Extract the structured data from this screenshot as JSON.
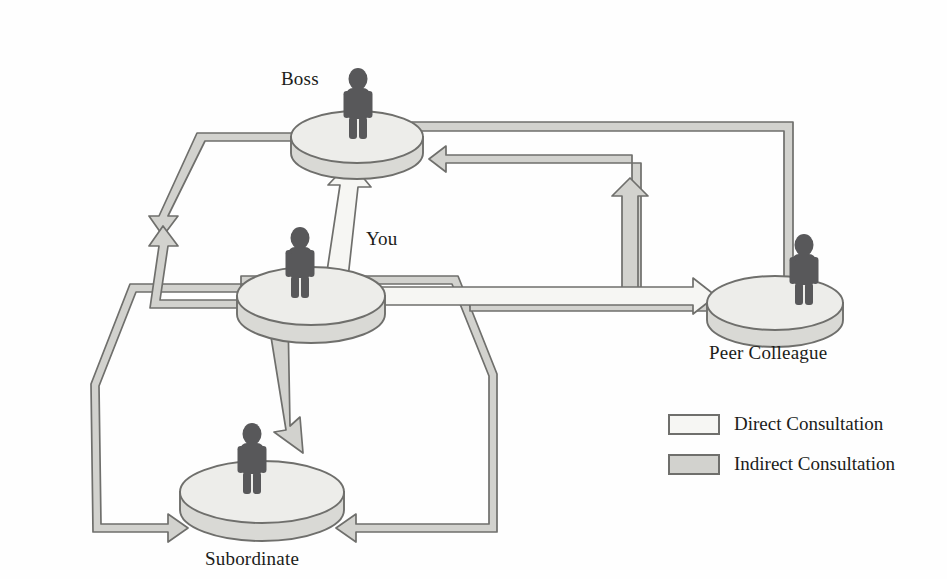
{
  "diagram": {
    "nodes": [
      {
        "id": "boss",
        "label": "Boss",
        "label_x": 281,
        "label_y": 68,
        "cx": 357,
        "cy": 137,
        "rx": 66,
        "ry": 26,
        "figure": "person-silhouette"
      },
      {
        "id": "you",
        "label": "You",
        "label_x": 366,
        "label_y": 228,
        "cx": 311,
        "cy": 296,
        "rx": 74,
        "ry": 29,
        "figure": "person-silhouette"
      },
      {
        "id": "peer",
        "label": "Peer Colleague",
        "label_x": 709,
        "label_y": 342,
        "cx": 775,
        "cy": 303,
        "rx": 68,
        "ry": 27,
        "figure": "person-silhouette"
      },
      {
        "id": "subordinate",
        "label": "Subordinate",
        "label_x": 205,
        "label_y": 548,
        "cx": 262,
        "cy": 492,
        "rx": 82,
        "ry": 31,
        "figure": "person-silhouette"
      }
    ],
    "edges": [
      {
        "from": "you",
        "to": "boss",
        "kind": "direct",
        "shape": "vertical-arrow-up"
      },
      {
        "from": "you",
        "to": "peer",
        "kind": "direct",
        "shape": "horizontal-arrow-right"
      },
      {
        "from": "you",
        "to": "subordinate",
        "kind": "direct",
        "shape": "diagonal-arrow-down"
      },
      {
        "from": "boss",
        "to": "you",
        "kind": "indirect",
        "shape": "left-loop-bidirectional"
      },
      {
        "from": "boss",
        "to": "peer",
        "kind": "indirect",
        "shape": "right-outer-loop"
      },
      {
        "from": "peer",
        "to": "boss",
        "kind": "indirect",
        "shape": "right-inner-loop"
      },
      {
        "from": "you",
        "to": "subordinate",
        "kind": "indirect",
        "shape": "lower-left-loop"
      },
      {
        "from": "you",
        "to": "subordinate",
        "kind": "indirect",
        "shape": "lower-right-loop"
      }
    ]
  },
  "legend": {
    "items": [
      {
        "swatch": "direct",
        "label": "Direct Consultation"
      },
      {
        "swatch": "indirect",
        "label": "Indirect Consultation"
      }
    ]
  },
  "colors": {
    "direct_fill": "#f6f6f3",
    "indirect_fill": "#d2d2ce",
    "stroke": "#6f6f6c",
    "platform_top": "#ededea",
    "platform_side": "#d9d9d5",
    "figure": "#58585a",
    "text": "#201c19",
    "background": "#fefefe"
  }
}
